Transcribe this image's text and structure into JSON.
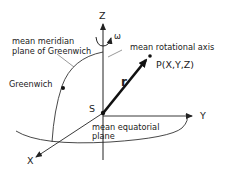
{
  "diagram": {
    "type": "coordinate-system",
    "axes": {
      "z_label": "Z",
      "y_label": "Y",
      "x_label": "X"
    },
    "rotation_symbol": "ω",
    "origin_label": "S",
    "vector_label": "r",
    "point_label": "P(X,Y,Z)",
    "labels": {
      "rotational_axis": "mean rotational axis",
      "meridian_line1": "mean meridian",
      "meridian_line2": "plane of Greenwich",
      "greenwich": "Greenwich",
      "equatorial_line1": "mean equatorial",
      "equatorial_line2": "plane"
    },
    "colors": {
      "ink": "#222222",
      "background": "#ffffff"
    }
  }
}
